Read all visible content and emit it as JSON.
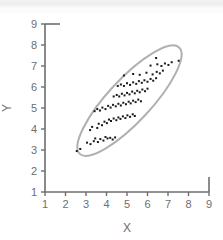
{
  "chart_data": {
    "type": "scatter",
    "title": "",
    "xlabel": "X",
    "ylabel": "Y",
    "xlim": [
      1,
      9
    ],
    "ylim": [
      1,
      9
    ],
    "xticks": [
      1,
      2,
      3,
      4,
      5,
      6,
      7,
      8,
      9
    ],
    "yticks": [
      1,
      2,
      3,
      4,
      5,
      6,
      7,
      8,
      9
    ],
    "xtick_labels": [
      "1",
      "2",
      "3",
      "4",
      "5",
      "6",
      "7",
      "8",
      "9"
    ],
    "ytick_labels": [
      "1",
      "2",
      "3",
      "4",
      "5",
      "6",
      "7",
      "8",
      "9"
    ],
    "grid": false,
    "legend": null,
    "marker": "square",
    "marker_color": "#1a1a1a",
    "marker_size": 2,
    "point_count": 96,
    "points": [
      [
        2.55,
        2.95
      ],
      [
        2.72,
        3.05
      ],
      [
        3.05,
        3.35
      ],
      [
        3.22,
        3.28
      ],
      [
        3.38,
        3.42
      ],
      [
        3.45,
        3.55
      ],
      [
        3.58,
        3.38
      ],
      [
        3.7,
        3.52
      ],
      [
        3.85,
        3.45
      ],
      [
        3.95,
        3.62
      ],
      [
        4.05,
        3.55
      ],
      [
        4.18,
        3.58
      ],
      [
        4.3,
        3.5
      ],
      [
        4.42,
        3.6
      ],
      [
        3.2,
        3.95
      ],
      [
        3.3,
        4.1
      ],
      [
        3.55,
        4.05
      ],
      [
        3.62,
        4.25
      ],
      [
        3.78,
        4.18
      ],
      [
        3.9,
        4.35
      ],
      [
        4.02,
        4.28
      ],
      [
        4.12,
        4.45
      ],
      [
        4.22,
        4.38
      ],
      [
        4.35,
        4.5
      ],
      [
        4.48,
        4.42
      ],
      [
        4.58,
        4.55
      ],
      [
        4.68,
        4.48
      ],
      [
        4.8,
        4.6
      ],
      [
        4.92,
        4.52
      ],
      [
        5.02,
        4.65
      ],
      [
        5.15,
        4.58
      ],
      [
        5.28,
        4.7
      ],
      [
        5.38,
        4.62
      ],
      [
        3.42,
        4.85
      ],
      [
        3.55,
        4.95
      ],
      [
        3.68,
        4.88
      ],
      [
        3.8,
        5.02
      ],
      [
        3.95,
        4.95
      ],
      [
        4.08,
        5.1
      ],
      [
        4.2,
        5.02
      ],
      [
        4.32,
        5.15
      ],
      [
        4.45,
        5.08
      ],
      [
        4.58,
        5.2
      ],
      [
        4.7,
        5.12
      ],
      [
        4.82,
        5.25
      ],
      [
        4.95,
        5.18
      ],
      [
        5.08,
        5.3
      ],
      [
        5.18,
        5.22
      ],
      [
        5.3,
        5.35
      ],
      [
        5.42,
        5.28
      ],
      [
        5.55,
        5.4
      ],
      [
        5.68,
        5.32
      ],
      [
        4.35,
        5.55
      ],
      [
        4.5,
        5.62
      ],
      [
        4.62,
        5.55
      ],
      [
        4.75,
        5.68
      ],
      [
        4.88,
        5.6
      ],
      [
        5.0,
        5.72
      ],
      [
        5.12,
        5.65
      ],
      [
        5.25,
        5.78
      ],
      [
        5.38,
        5.7
      ],
      [
        5.5,
        5.82
      ],
      [
        5.62,
        5.75
      ],
      [
        5.75,
        5.88
      ],
      [
        5.88,
        5.8
      ],
      [
        6.0,
        5.92
      ],
      [
        4.55,
        6.05
      ],
      [
        4.7,
        6.12
      ],
      [
        4.85,
        6.05
      ],
      [
        5.0,
        6.18
      ],
      [
        5.15,
        6.1
      ],
      [
        5.3,
        6.22
      ],
      [
        5.45,
        6.15
      ],
      [
        5.58,
        6.28
      ],
      [
        5.72,
        6.2
      ],
      [
        5.85,
        6.32
      ],
      [
        6.0,
        6.25
      ],
      [
        6.15,
        6.38
      ],
      [
        6.28,
        6.3
      ],
      [
        6.42,
        6.42
      ],
      [
        4.85,
        6.55
      ],
      [
        5.3,
        6.62
      ],
      [
        5.62,
        6.58
      ],
      [
        5.95,
        6.68
      ],
      [
        6.25,
        6.6
      ],
      [
        6.45,
        6.72
      ],
      [
        6.6,
        6.65
      ],
      [
        6.75,
        6.78
      ],
      [
        6.15,
        7.02
      ],
      [
        6.48,
        7.08
      ],
      [
        6.68,
        7.0
      ],
      [
        6.85,
        7.12
      ],
      [
        7.02,
        7.05
      ],
      [
        7.18,
        7.18
      ],
      [
        6.42,
        7.38
      ],
      [
        7.52,
        7.25
      ]
    ],
    "ellipse": {
      "label": "confidence-ellipse",
      "center_x": 5.12,
      "center_y": 5.35,
      "semi_major": 3.55,
      "semi_minor": 1.02,
      "rotation_deg": -47,
      "stroke_color": "#b0b0b0",
      "stroke_width": 2,
      "fill": "none"
    },
    "axis_color": "#6e6e6e",
    "frame": "left-bottom"
  }
}
